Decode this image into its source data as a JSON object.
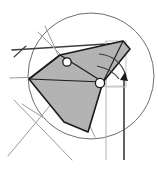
{
  "figure": {
    "type": "line-drawing",
    "canvas": {
      "width": 158,
      "height": 169,
      "background": "#ffffff"
    },
    "colors": {
      "shape_fill": "#b3b3b3",
      "shape_stroke": "#1a1a1a",
      "construction_dark": "#3d3d3d",
      "construction_light": "#9a9a9a",
      "construction_lighter": "#b9b9b9",
      "circle_stroke": "#6e6e6e",
      "marker_fill": "#ffffff",
      "marker_stroke": "#1a1a1a",
      "arrow_fill": "#1a1a1a"
    },
    "construction_circle": {
      "label": "construction circle",
      "cx": 91,
      "cy": 76,
      "r": 63,
      "stroke_width": 1
    },
    "shaded_polygon": {
      "label": "shaded fan wedge",
      "points": "123,41 130,49 103,82 88,132 64,122 29,79 60,55",
      "fill": "#b3b3b3",
      "stroke": "#1a1a1a",
      "stroke_width": 1.6
    },
    "polygon_inner_edges": [
      {
        "name": "fold-edge-upper",
        "x1": 60,
        "y1": 55,
        "x2": 103,
        "y2": 82
      },
      {
        "name": "fold-edge-apex",
        "x1": 123,
        "y1": 41,
        "x2": 103,
        "y2": 82
      },
      {
        "name": "fold-edge-lower",
        "x1": 29,
        "y1": 79,
        "x2": 103,
        "y2": 82
      },
      {
        "name": "fold-edge-left",
        "x1": 60,
        "y1": 55,
        "x2": 29,
        "y2": 79
      }
    ],
    "construction_lines": [
      {
        "name": "horizontal-baseline-dark",
        "x1": 12,
        "y1": 50,
        "x2": 122,
        "y2": 43,
        "stroke": "#3d3d3d",
        "width": 1.6
      },
      {
        "name": "tick-mark-left",
        "x1": 14,
        "y1": 57,
        "x2": 26,
        "y2": 46,
        "stroke": "#3d3d3d",
        "width": 1.1
      },
      {
        "name": "horizontal-secondary-gray",
        "x1": 10,
        "y1": 78,
        "x2": 64,
        "y2": 76,
        "stroke": "#9a9a9a",
        "width": 1.1
      },
      {
        "name": "radius-line-to-marker-a",
        "x1": 67,
        "y1": 62,
        "x2": 112,
        "y2": 54,
        "stroke": "#9a9a9a",
        "width": 1
      },
      {
        "name": "radius-line-through-circle",
        "x1": 45,
        "y1": 26,
        "x2": 95,
        "y2": 137,
        "stroke": "#9a9a9a",
        "width": 1
      },
      {
        "name": "chord-line-upper-left",
        "x1": 38,
        "y1": 32,
        "x2": 69,
        "y2": 63,
        "stroke": "#9a9a9a",
        "width": 1
      },
      {
        "name": "chord-line-to-lower-right",
        "x1": 67,
        "y1": 62,
        "x2": 100,
        "y2": 83,
        "stroke": "#9a9a9a",
        "width": 1
      },
      {
        "name": "horizontal-through-pivot",
        "x1": 64,
        "y1": 87,
        "x2": 124,
        "y2": 86,
        "stroke": "#b9b9b9",
        "width": 1
      },
      {
        "name": "diagonal-cross-line-a",
        "x1": 14,
        "y1": 100,
        "x2": 72,
        "y2": 160,
        "stroke": "#9a9a9a",
        "width": 1
      },
      {
        "name": "diagonal-cross-line-b",
        "x1": 58,
        "y1": 96,
        "x2": 8,
        "y2": 156,
        "stroke": "#9a9a9a",
        "width": 1
      },
      {
        "name": "short-tangent-lower-left",
        "x1": 22,
        "y1": 104,
        "x2": 44,
        "y2": 118,
        "stroke": "#9a9a9a",
        "width": 1
      }
    ],
    "vertical_lines": [
      {
        "name": "vertical-guide-light",
        "x1": 106,
        "y1": 41,
        "x2": 106,
        "y2": 160,
        "stroke": "#b9b9b9",
        "width": 1.1
      },
      {
        "name": "vertical-guide-dark",
        "x1": 124,
        "y1": 78,
        "x2": 124,
        "y2": 160,
        "stroke": "#3d3d3d",
        "width": 1.6
      }
    ],
    "light_rectangle": {
      "name": "guide-rectangle",
      "x": 106,
      "y": 41,
      "width": 20,
      "height": 46,
      "stroke": "#c4c4c4",
      "width_px": 1
    },
    "rotation_arcs": [
      {
        "name": "rotation-arc-outer",
        "path": "M 99 54 Q 120 56 126 76",
        "stroke": "#3d3d3d",
        "width": 1.2
      },
      {
        "name": "rotation-arc-inner",
        "path": "M 97 66 Q 112 69 119 79",
        "stroke": "#3d3d3d",
        "width": 1.2
      }
    ],
    "arrow_head": {
      "name": "rotation-direction-arrow",
      "points": "125,72 120,80 128,81",
      "fill": "#1a1a1a"
    },
    "vertex_markers": [
      {
        "name": "vertex-marker-a",
        "cx": 67,
        "cy": 62,
        "r": 4.2,
        "label": "pivot A"
      },
      {
        "name": "vertex-marker-b",
        "cx": 100,
        "cy": 83,
        "r": 4.6,
        "label": "pivot B"
      }
    ]
  }
}
